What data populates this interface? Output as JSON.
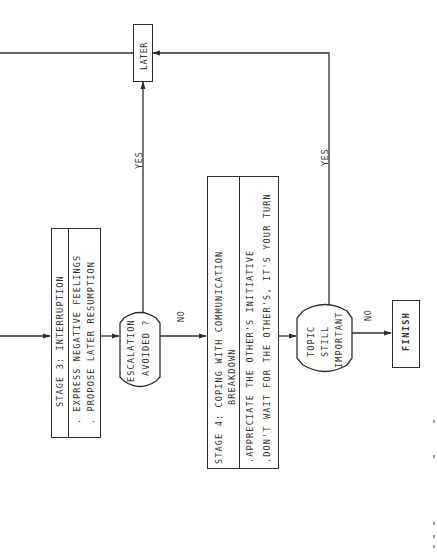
{
  "diagram": {
    "type": "flowchart",
    "orientation": "rotated 90 degrees counter-clockwise",
    "nodes": {
      "later": {
        "label": "LATER",
        "shape": "rectangle"
      },
      "stage3": {
        "title": "STAGE 3: INTERRUPTION",
        "items": [
          ". EXPRESS NEGATIVE FEELINGS",
          ". PROPOSE LATER RESUMPTION"
        ],
        "shape": "rectangle"
      },
      "escalation": {
        "lines": [
          "ESCALATION",
          "AVOIDED ?"
        ],
        "shape": "decision-hexagon"
      },
      "stage4": {
        "title_line1": "STAGE 4: COPING WITH COMMUNICATION",
        "title_line2": "BREAKDOWN",
        "items": [
          ".APPRECIATE THE OTHER'S INITIATIVE",
          ".DON'T WAIT FOR THE OTHER'S, IT'S YOUR TURN"
        ],
        "shape": "rectangle"
      },
      "topic": {
        "lines": [
          "TOPIC",
          "STILL",
          "IMPORTANT"
        ],
        "shape": "decision-hexagon"
      },
      "finish": {
        "label": "FINISH",
        "shape": "rectangle"
      }
    },
    "edges": {
      "escalation_yes": "YES",
      "escalation_no": "NO",
      "topic_yes": "YES",
      "topic_no": "NO"
    },
    "colors": {
      "ink": "#2e2e2e",
      "background": "#ffffff"
    }
  }
}
